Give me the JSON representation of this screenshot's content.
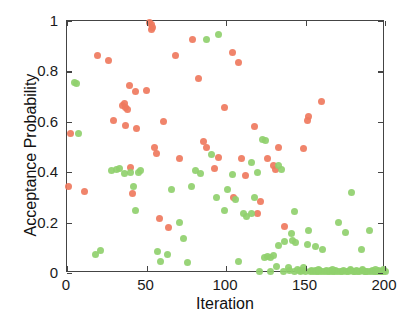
{
  "chart_data": {
    "type": "scatter",
    "title": "",
    "xlabel": "Iteration",
    "ylabel": "Acceptance Probability",
    "xlim": [
      0,
      200
    ],
    "ylim": [
      0,
      1
    ],
    "xticks": [
      0,
      50,
      100,
      150,
      200
    ],
    "xticklabels": [
      "0",
      "50",
      "100",
      "150",
      "200"
    ],
    "yticks": [
      0,
      0.2,
      0.4,
      0.6,
      0.8,
      1
    ],
    "yticklabels": [
      "0",
      "0.2",
      "0.4",
      "0.6",
      "0.8",
      "1"
    ],
    "grid": false,
    "legend": "none",
    "colors": {
      "accepted": "#ef7a5e",
      "rejected": "#90d06e"
    },
    "series": [
      {
        "name": "accepted",
        "color": "#ef7a5e",
        "points": [
          [
            1,
            0.345
          ],
          [
            2,
            0.555
          ],
          [
            11,
            0.325
          ],
          [
            19,
            0.865
          ],
          [
            26,
            0.845
          ],
          [
            29,
            0.605
          ],
          [
            35,
            0.665
          ],
          [
            36,
            0.672
          ],
          [
            37,
            0.655
          ],
          [
            38,
            0.648
          ],
          [
            37,
            0.585
          ],
          [
            39,
            0.745
          ],
          [
            40,
            0.42
          ],
          [
            43,
            0.72
          ],
          [
            44,
            0.575
          ],
          [
            41,
            0.315
          ],
          [
            52,
            0.995
          ],
          [
            53,
            0.985
          ],
          [
            54,
            0.975
          ],
          [
            53,
            0.965
          ],
          [
            50,
            0.725
          ],
          [
            55,
            0.5
          ],
          [
            56,
            0.475
          ],
          [
            61,
            0.6
          ],
          [
            58,
            0.215
          ],
          [
            64,
            0.18
          ],
          [
            71,
            0.455
          ],
          [
            68,
            0.865
          ],
          [
            79,
            0.925
          ],
          [
            83,
            0.77
          ],
          [
            88,
            0.5
          ],
          [
            86,
            0.52
          ],
          [
            95,
            0.46
          ],
          [
            93,
            0.415
          ],
          [
            99,
            0.655
          ],
          [
            104,
            0.875
          ],
          [
            108,
            0.835
          ],
          [
            110,
            0.455
          ],
          [
            112,
            0.385
          ],
          [
            105,
            0.3
          ],
          [
            118,
            0.58
          ],
          [
            122,
            0.285
          ],
          [
            126,
            0.455
          ],
          [
            130,
            0.425
          ],
          [
            131,
            0.41
          ],
          [
            133,
            0.5
          ],
          [
            137,
            0.185
          ],
          [
            120,
            0.235
          ],
          [
            149,
            0.495
          ],
          [
            152,
            0.62
          ],
          [
            151,
            0.605
          ],
          [
            160,
            0.68
          ]
        ]
      },
      {
        "name": "rejected",
        "color": "#90d06e",
        "points": [
          [
            5,
            0.755
          ],
          [
            6,
            0.752
          ],
          [
            7,
            0.555
          ],
          [
            18,
            0.075
          ],
          [
            21,
            0.09
          ],
          [
            28,
            0.405
          ],
          [
            31,
            0.41
          ],
          [
            33,
            0.415
          ],
          [
            36,
            0.395
          ],
          [
            40,
            0.4
          ],
          [
            42,
            0.345
          ],
          [
            43,
            0.248
          ],
          [
            45,
            0.4
          ],
          [
            46,
            0.405
          ],
          [
            57,
            0.085
          ],
          [
            59,
            0.045
          ],
          [
            63,
            0.075
          ],
          [
            66,
            0.33
          ],
          [
            71,
            0.2
          ],
          [
            73,
            0.135
          ],
          [
            76,
            0.04
          ],
          [
            78,
            0.345
          ],
          [
            81,
            0.405
          ],
          [
            84,
            0.395
          ],
          [
            88,
            0.925
          ],
          [
            91,
            0.47
          ],
          [
            95,
            0.945
          ],
          [
            94,
            0.3
          ],
          [
            99,
            0.25
          ],
          [
            101,
            0.33
          ],
          [
            104,
            0.39
          ],
          [
            106,
            0.29
          ],
          [
            108,
            0.045
          ],
          [
            111,
            0.235
          ],
          [
            113,
            0.225
          ],
          [
            116,
            0.235
          ],
          [
            118,
            0.3
          ],
          [
            121,
            0.005
          ],
          [
            123,
            0.53
          ],
          [
            125,
            0.525
          ],
          [
            126,
            0.065
          ],
          [
            128,
            0.06
          ],
          [
            130,
            0.07
          ],
          [
            132,
            0.025
          ],
          [
            133,
            0.425
          ],
          [
            135,
            0.41
          ],
          [
            137,
            0.125
          ],
          [
            139,
            0.02
          ],
          [
            141,
            0.155
          ],
          [
            142,
            0.13
          ],
          [
            144,
            0.12
          ],
          [
            146,
            0.01
          ],
          [
            147,
            0.005
          ],
          [
            148,
            0.01
          ],
          [
            150,
            0.005
          ],
          [
            151,
            0.115
          ],
          [
            152,
            0.17
          ],
          [
            153,
            0.005
          ],
          [
            154,
            0.01
          ],
          [
            155,
            0.005
          ],
          [
            156,
            0.01
          ],
          [
            157,
            0.005
          ],
          [
            158,
            0.005
          ],
          [
            159,
            0.01
          ],
          [
            160,
            0.005
          ],
          [
            161,
            0.095
          ],
          [
            162,
            0.005
          ],
          [
            163,
            0.01
          ],
          [
            164,
            0.005
          ],
          [
            165,
            0.005
          ],
          [
            166,
            0.01
          ],
          [
            167,
            0.005
          ],
          [
            168,
            0.005
          ],
          [
            169,
            0.01
          ],
          [
            170,
            0.005
          ],
          [
            171,
            0.2
          ],
          [
            172,
            0.005
          ],
          [
            173,
            0.005
          ],
          [
            174,
            0.01
          ],
          [
            175,
            0.16
          ],
          [
            176,
            0.005
          ],
          [
            177,
            0.005
          ],
          [
            178,
            0.01
          ],
          [
            179,
            0.32
          ],
          [
            180,
            0.005
          ],
          [
            181,
            0.005
          ],
          [
            182,
            0.01
          ],
          [
            183,
            0.005
          ],
          [
            184,
            0.005
          ],
          [
            185,
            0.095
          ],
          [
            186,
            0.01
          ],
          [
            187,
            0.005
          ],
          [
            188,
            0.005
          ],
          [
            189,
            0.005
          ],
          [
            190,
            0.17
          ],
          [
            191,
            0.005
          ],
          [
            192,
            0.01
          ],
          [
            193,
            0.005
          ],
          [
            194,
            0.005
          ],
          [
            195,
            0.005
          ],
          [
            196,
            0.01
          ],
          [
            197,
            0.005
          ],
          [
            198,
            0.005
          ],
          [
            199,
            0.005
          ],
          [
            200,
            0.005
          ],
          [
            145,
            0.015
          ],
          [
            149,
            0.02
          ],
          [
            158,
            0.015
          ],
          [
            167,
            0.015
          ],
          [
            178,
            0.015
          ],
          [
            186,
            0.015
          ],
          [
            194,
            0.015
          ],
          [
            199,
            0.015
          ],
          [
            143,
            0.005
          ],
          [
            140,
            0.01
          ],
          [
            136,
            0.005
          ],
          [
            128,
            0.005
          ],
          [
            156,
            0.105
          ],
          [
            143,
            0.245
          ],
          [
            120,
            0.4
          ],
          [
            116,
            0.44
          ],
          [
            133,
            0.11
          ],
          [
            124,
            0.06
          ]
        ]
      }
    ]
  }
}
